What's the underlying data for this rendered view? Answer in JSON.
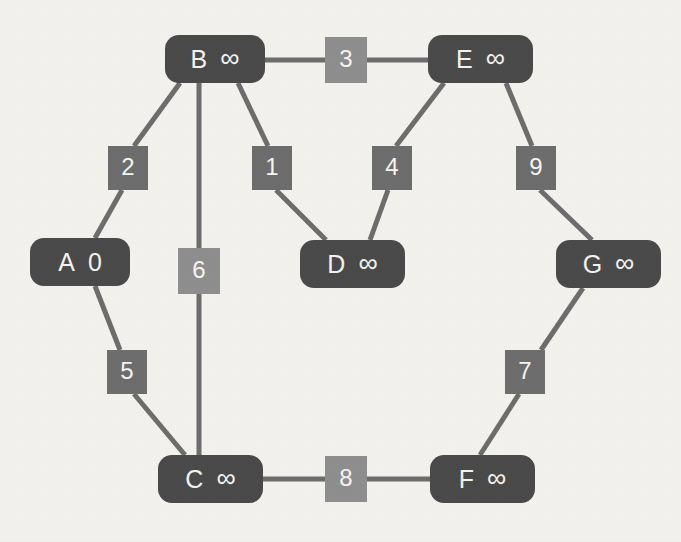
{
  "diagram": {
    "background_color": "#f2f1ee",
    "node_color": "#4a4a4a",
    "node_text_color": "#f3f2ef",
    "edge_color": "#6d6d6d",
    "weight_box_color_dark": "#6d6d6d",
    "weight_box_color_light": "#8e8e8e"
  },
  "nodes": [
    {
      "id": "A",
      "dist": "0",
      "x": 30,
      "y": 238,
      "w": 100,
      "h": 48
    },
    {
      "id": "B",
      "dist": "∞",
      "x": 165,
      "y": 35,
      "w": 100,
      "h": 48
    },
    {
      "id": "C",
      "dist": "∞",
      "x": 158,
      "y": 455,
      "w": 105,
      "h": 48
    },
    {
      "id": "D",
      "dist": "∞",
      "x": 300,
      "y": 240,
      "w": 105,
      "h": 48
    },
    {
      "id": "E",
      "dist": "∞",
      "x": 428,
      "y": 35,
      "w": 105,
      "h": 48
    },
    {
      "id": "F",
      "dist": "∞",
      "x": 430,
      "y": 455,
      "w": 105,
      "h": 48
    },
    {
      "id": "G",
      "dist": "∞",
      "x": 556,
      "y": 240,
      "w": 105,
      "h": 48
    }
  ],
  "edges": [
    {
      "from": "A",
      "to": "B",
      "weight": "2",
      "box_x": 108,
      "box_y": 146,
      "box_w": 40,
      "box_h": 44,
      "style": "dark"
    },
    {
      "from": "A",
      "to": "C",
      "weight": "5",
      "box_x": 107,
      "box_y": 350,
      "box_w": 40,
      "box_h": 44,
      "style": "dark"
    },
    {
      "from": "B",
      "to": "C",
      "weight": "6",
      "box_x": 178,
      "box_y": 248,
      "box_w": 42,
      "box_h": 46,
      "style": "light"
    },
    {
      "from": "B",
      "to": "D",
      "weight": "1",
      "box_x": 252,
      "box_y": 146,
      "box_w": 40,
      "box_h": 44,
      "style": "dark"
    },
    {
      "from": "B",
      "to": "E",
      "weight": "3",
      "box_x": 325,
      "box_y": 37,
      "box_w": 42,
      "box_h": 46,
      "style": "light"
    },
    {
      "from": "D",
      "to": "E",
      "weight": "4",
      "box_x": 372,
      "box_y": 146,
      "box_w": 40,
      "box_h": 44,
      "style": "dark"
    },
    {
      "from": "E",
      "to": "G",
      "weight": "9",
      "box_x": 516,
      "box_y": 146,
      "box_w": 40,
      "box_h": 44,
      "style": "dark"
    },
    {
      "from": "C",
      "to": "F",
      "weight": "8",
      "box_x": 325,
      "box_y": 456,
      "box_w": 42,
      "box_h": 46,
      "style": "light"
    },
    {
      "from": "F",
      "to": "G",
      "weight": "7",
      "box_x": 505,
      "box_y": 350,
      "box_w": 40,
      "box_h": 44,
      "style": "dark"
    }
  ],
  "edge_segments": [
    {
      "name": "A-2",
      "x1": 95,
      "y1": 238,
      "x2": 122,
      "y2": 190
    },
    {
      "name": "2-B",
      "x1": 134,
      "y1": 146,
      "x2": 180,
      "y2": 83
    },
    {
      "name": "A-5",
      "x1": 95,
      "y1": 286,
      "x2": 120,
      "y2": 350
    },
    {
      "name": "5-C",
      "x1": 134,
      "y1": 394,
      "x2": 185,
      "y2": 455
    },
    {
      "name": "B-6",
      "x1": 199,
      "y1": 83,
      "x2": 199,
      "y2": 248
    },
    {
      "name": "6-C",
      "x1": 199,
      "y1": 294,
      "x2": 199,
      "y2": 455
    },
    {
      "name": "B-1",
      "x1": 238,
      "y1": 83,
      "x2": 268,
      "y2": 146
    },
    {
      "name": "1-D",
      "x1": 276,
      "y1": 190,
      "x2": 326,
      "y2": 240
    },
    {
      "name": "B-3",
      "x1": 265,
      "y1": 60,
      "x2": 325,
      "y2": 60
    },
    {
      "name": "3-E",
      "x1": 367,
      "y1": 60,
      "x2": 428,
      "y2": 60
    },
    {
      "name": "D-4",
      "x1": 370,
      "y1": 240,
      "x2": 388,
      "y2": 190
    },
    {
      "name": "4-E",
      "x1": 396,
      "y1": 146,
      "x2": 444,
      "y2": 83
    },
    {
      "name": "E-9",
      "x1": 506,
      "y1": 83,
      "x2": 532,
      "y2": 146
    },
    {
      "name": "9-G",
      "x1": 540,
      "y1": 190,
      "x2": 592,
      "y2": 240
    },
    {
      "name": "C-8",
      "x1": 263,
      "y1": 479,
      "x2": 325,
      "y2": 479
    },
    {
      "name": "8-F",
      "x1": 367,
      "y1": 479,
      "x2": 430,
      "y2": 479
    },
    {
      "name": "G-7",
      "x1": 583,
      "y1": 288,
      "x2": 541,
      "y2": 350
    },
    {
      "name": "7-F",
      "x1": 519,
      "y1": 394,
      "x2": 480,
      "y2": 455
    }
  ]
}
